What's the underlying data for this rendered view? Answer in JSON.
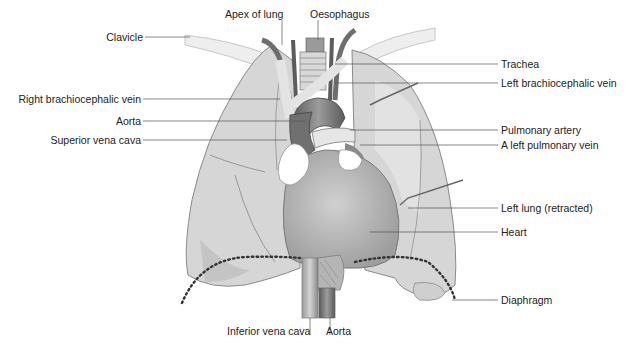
{
  "figure": {
    "colors": {
      "lung_fill": "#d6d6d6",
      "lung_stroke": "#8a8a8a",
      "heart_fill": "#bdbdbd",
      "vessel_dark": "#6e6e6e",
      "leader_line": "#555555",
      "diaphragm_dots": "#333333"
    }
  },
  "labels": {
    "left_side": [
      {
        "id": "clavicle",
        "text": "Clavicle"
      },
      {
        "id": "right-brachiocephalic-vein",
        "text": "Right brachiocephalic vein"
      },
      {
        "id": "aorta-upper",
        "text": "Aorta"
      },
      {
        "id": "superior-vena-cava",
        "text": "Superior vena cava"
      }
    ],
    "top": [
      {
        "id": "apex-of-lung",
        "text": "Apex of lung"
      },
      {
        "id": "oesophagus",
        "text": "Oesophagus"
      }
    ],
    "right_side": [
      {
        "id": "trachea",
        "text": "Trachea"
      },
      {
        "id": "left-brachiocephalic-vein",
        "text": "Left brachiocephalic vein"
      },
      {
        "id": "pulmonary-artery",
        "text": "Pulmonary artery"
      },
      {
        "id": "left-pulmonary-vein",
        "text": "A left pulmonary vein"
      },
      {
        "id": "left-lung-retracted",
        "text": "Left lung (retracted)"
      },
      {
        "id": "heart",
        "text": "Heart"
      },
      {
        "id": "diaphragm",
        "text": "Diaphragm"
      }
    ],
    "bottom": [
      {
        "id": "inferior-vena-cava",
        "text": "Inferior vena cava"
      },
      {
        "id": "aorta-lower",
        "text": "Aorta"
      }
    ]
  }
}
